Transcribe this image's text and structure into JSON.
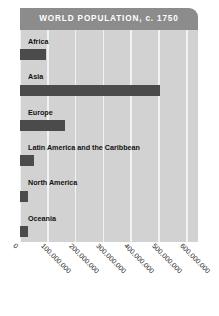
{
  "chart_data": {
    "type": "bar",
    "orientation": "horizontal",
    "title": "WORLD POPULATION, c. 1750",
    "xlabel": "",
    "ylabel": "",
    "categories": [
      "Africa",
      "Asia",
      "Europe",
      "Latin America and the Caribbean",
      "North America",
      "Oceania"
    ],
    "values": [
      95000000,
      505000000,
      163000000,
      50000000,
      30000000,
      30000000
    ],
    "xlim": [
      0,
      640000000
    ],
    "xticks": [
      0,
      100000000,
      200000000,
      300000000,
      400000000,
      500000000,
      600000000
    ],
    "xtick_labels": [
      "0",
      "100,000,000",
      "200,000,000",
      "300,000,000",
      "400,000,000",
      "500,000,000",
      "600,000,000"
    ],
    "grid": true,
    "legend": false
  },
  "style": {
    "title_bar_color": "#8c8c8c",
    "title_text_color": "#ffffff",
    "plot_background_color": "#d2d2d2",
    "gridline_color": "#f2f2f2",
    "bar_color": "#4b4b4b",
    "label_text_color": "#121212",
    "page_background_color": "#ffffff"
  }
}
